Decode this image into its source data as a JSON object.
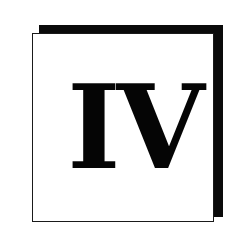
{
  "badge": {
    "numeral": "IV",
    "colors": {
      "background": "#ffffff",
      "shadow": "#0a0a0a",
      "border": "#1a1a1a",
      "text": "#050505"
    }
  }
}
